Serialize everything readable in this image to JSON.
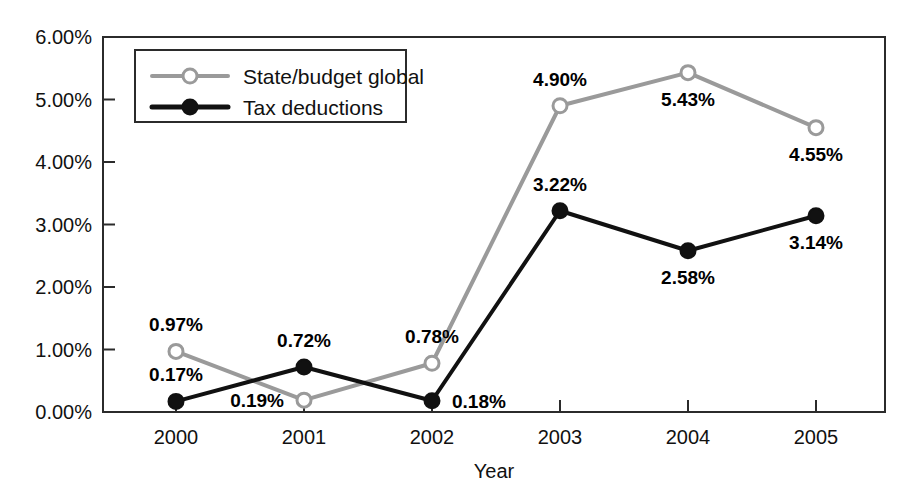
{
  "chart_data": {
    "type": "line",
    "title": "",
    "xlabel": "Year",
    "ylabel": "",
    "categories": [
      "2000",
      "2001",
      "2002",
      "2003",
      "2004",
      "2005"
    ],
    "ylim": [
      0,
      6
    ],
    "ytick_labels": [
      "0.00%",
      "1.00%",
      "2.00%",
      "3.00%",
      "4.00%",
      "5.00%",
      "6.00%"
    ],
    "ytick_values": [
      0,
      1,
      2,
      3,
      4,
      5,
      6
    ],
    "grid": false,
    "legend_position": "top-left-inside",
    "series": [
      {
        "name": "State/budget global",
        "color": "#9a9a9a",
        "marker": "open-circle",
        "values": [
          0.97,
          0.19,
          0.78,
          4.9,
          5.43,
          4.55
        ],
        "labels": [
          "0.97%",
          "0.19%",
          "0.78%",
          "4.90%",
          "5.43%",
          "4.55%"
        ],
        "label_positions": [
          "above",
          "left",
          "above",
          "above",
          "below",
          "below"
        ]
      },
      {
        "name": "Tax deductions",
        "color": "#111111",
        "marker": "filled-circle",
        "values": [
          0.17,
          0.72,
          0.18,
          3.22,
          2.58,
          3.14
        ],
        "labels": [
          "0.17%",
          "0.72%",
          "0.18%",
          "3.22%",
          "2.58%",
          "3.14%"
        ],
        "label_positions": [
          "above",
          "above",
          "right",
          "above",
          "below",
          "below"
        ]
      }
    ]
  },
  "legend": {
    "items": [
      {
        "label": "State/budget global",
        "color": "#9a9a9a",
        "marker": "open-circle"
      },
      {
        "label": "Tax deductions",
        "color": "#111111",
        "marker": "filled-circle"
      }
    ]
  },
  "axes": {
    "x_title": "Year",
    "x_tick_labels": [
      "2000",
      "2001",
      "2002",
      "2003",
      "2004",
      "2005"
    ],
    "y_tick_labels": [
      "6.00%",
      "5.00%",
      "4.00%",
      "3.00%",
      "2.00%",
      "1.00%",
      "0.00%"
    ]
  },
  "colors": {
    "series_gray": "#9a9a9a",
    "series_black": "#111111",
    "frame": "#2b2b2b",
    "background": "#ffffff"
  }
}
